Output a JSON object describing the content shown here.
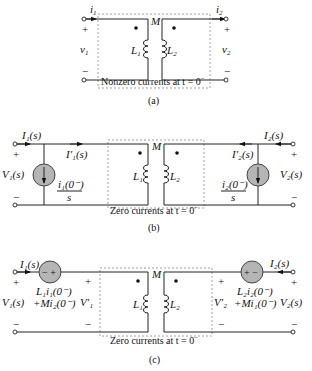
{
  "panel_a": {
    "caption": "(a)",
    "box_label": "Nonzero currents at t = 0",
    "box_label_sup": "−",
    "mutual": "M",
    "current_left": "i",
    "current_left_sub": "1",
    "current_right": "i",
    "current_right_sub": "2",
    "voltage_left": "v",
    "voltage_left_sub": "1",
    "voltage_right": "v",
    "voltage_right_sub": "2",
    "inductor_left": "L",
    "inductor_left_sub": "1",
    "inductor_right": "L",
    "inductor_right_sub": "2",
    "plus": "+",
    "minus": "−"
  },
  "panel_b": {
    "caption": "(b)",
    "box_label": "Zero currents at t = 0",
    "box_label_sup": "−",
    "mutual": "M",
    "current_left": "I₁(s)",
    "current_left_inner": "I′₁(s)",
    "current_right": "I₂(s)",
    "current_right_inner": "I′₂(s)",
    "voltage_left": "V₁(s)",
    "voltage_right": "V₂(s)",
    "source_left_num": "i₁(0⁻)",
    "source_left_den": "s",
    "source_right_num": "i₂(0⁻)",
    "source_right_den": "s",
    "inductor_left": "L₁",
    "inductor_right": "L₂",
    "plus": "+",
    "minus": "−"
  },
  "panel_c": {
    "caption": "(c)",
    "box_label": "Zero currents at t = 0",
    "box_label_sup": "−",
    "mutual": "M",
    "current_left": "I₁(s)",
    "current_right": "I₂(s)",
    "voltage_left": "V₁(s)",
    "voltage_right": "V₂(s)",
    "voltage_left_inner": "V′₁",
    "voltage_right_inner": "V′₂",
    "source_left_line1": "L₁i₁(0⁻)",
    "source_left_line2": "+Mi₂(0⁻)",
    "source_right_line1": "L₂i₂(0⁻)",
    "source_right_line2": "+Mi₁(0⁻)",
    "source_left_polarity": "− +",
    "source_right_polarity": "+ −",
    "inductor_left": "L₁",
    "inductor_right": "L₂",
    "plus": "+",
    "minus": "−"
  }
}
